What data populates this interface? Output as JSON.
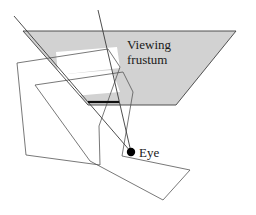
{
  "figure": {
    "title_label": "Viewing frustum",
    "labels": {
      "frustum_line1": "Viewing",
      "frustum_line2": "frustum",
      "eye": "Eye"
    },
    "colors": {
      "frustum_fill": "#d2d2d2",
      "frustum_stroke": "#404040",
      "polygon_stroke": "#555555",
      "ray_stroke": "#3a3a3a",
      "near_plane_stroke": "#101010",
      "eye_dot": "#000000",
      "background": "#ffffff",
      "text": "#1a1a1a"
    },
    "geometry": {
      "frustum_polygon": "23,31 236,31 176,105 88,105",
      "frustum_cutout_upper": "56,52 117,47 120,68 58,75",
      "frustum_cutout_lower": "20,78 112,70 120,92 27,100",
      "near_plane_segment": "88,102 119,102",
      "ray_left": "14,16 131,152",
      "ray_right": "98,10 131,152",
      "eye_point": {
        "x": 131,
        "y": 152,
        "r": 4.2
      },
      "outer_polygon": "17,63 108,49 120,67 99,126 100,165 26,155",
      "inner_polygon": "35,85 123,72 133,92 122,156 190,170 163,200 90,161",
      "label_viewing_pos": {
        "x": 127,
        "y": 49
      },
      "label_frustum_pos": {
        "x": 127,
        "y": 64
      },
      "label_eye_pos": {
        "x": 139,
        "y": 157
      }
    }
  }
}
